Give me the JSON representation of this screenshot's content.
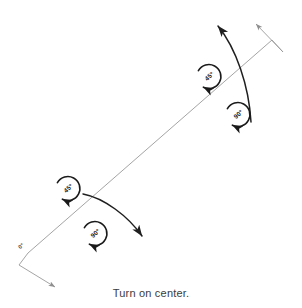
{
  "figure": {
    "caption": "Turn on center.",
    "background_color": "#ffffff",
    "axis_line_color": "#9a9a9a",
    "curved_arrow_color": "#1f1f1f",
    "rotation_symbol_color": "#1a1a1a",
    "caption_color": "#3b3b3b"
  },
  "axis": {
    "name": "center-axis",
    "start_label": "0°",
    "start_x": 28,
    "start_y": 253,
    "end_x": 272,
    "end_y": 40
  },
  "rotation_symbols": [
    {
      "id": "rotation-upper-outer",
      "label": "45°",
      "cx": 209,
      "cy": 76,
      "r": 12,
      "direction": "counterclockwise"
    },
    {
      "id": "rotation-upper-inner",
      "label": "90°",
      "cx": 238,
      "cy": 114,
      "r": 12,
      "direction": "counterclockwise"
    },
    {
      "id": "rotation-lower-outer",
      "label": "45°",
      "cx": 68,
      "cy": 188,
      "r": 12,
      "direction": "counterclockwise"
    },
    {
      "id": "rotation-lower-inner",
      "label": "90°",
      "cx": 95,
      "cy": 233,
      "r": 12,
      "direction": "counterclockwise"
    }
  ],
  "curved_arrows": [
    {
      "id": "turn-arrow-upper",
      "from_x": 251,
      "from_y": 122,
      "to_x": 215,
      "to_y": 22
    },
    {
      "id": "turn-arrow-lower",
      "from_x": 83,
      "from_y": 194,
      "to_x": 144,
      "to_y": 238
    }
  ],
  "axis_end_markers": [
    {
      "id": "axis-end-upper",
      "label": "upper-right-tip"
    },
    {
      "id": "axis-end-lower",
      "label": "lower-left-tip"
    }
  ]
}
